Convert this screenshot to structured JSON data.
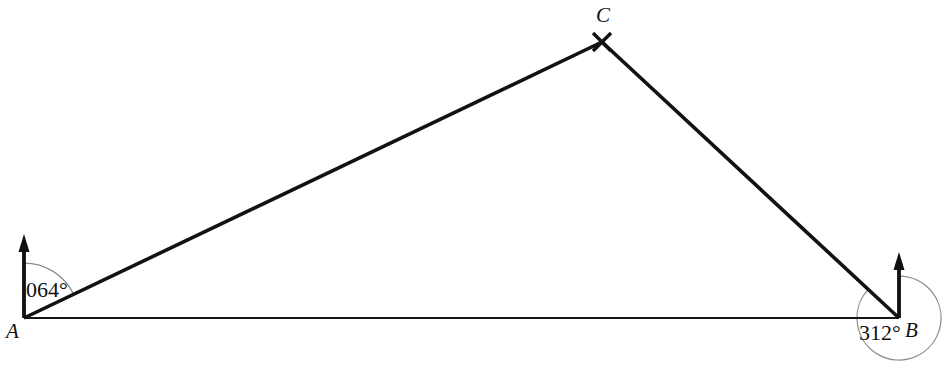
{
  "figure": {
    "type": "geometry-bearings-diagram",
    "background_color": "#ffffff",
    "width": 949,
    "height": 375
  },
  "points": {
    "A": {
      "label": "A",
      "x": 24,
      "y": 318,
      "label_x": 6,
      "label_y": 338
    },
    "B": {
      "label": "B",
      "x": 899,
      "y": 318,
      "label_x": 905,
      "label_y": 337
    },
    "C": {
      "label": "C",
      "x": 602,
      "y": 42,
      "label_x": 596,
      "label_y": 22
    }
  },
  "segments": [
    {
      "name": "segment-ac",
      "from": "A",
      "to": "C",
      "style": "thick"
    },
    {
      "name": "segment-cb",
      "from": "C",
      "to": "B",
      "style": "thick"
    },
    {
      "name": "segment-ab",
      "from": "A",
      "to": "B",
      "style": "thin"
    }
  ],
  "north_arrows": [
    {
      "name": "north-arrow-a",
      "at": "A",
      "base_x": 24,
      "base_y": 318,
      "tip_y": 237
    },
    {
      "name": "north-arrow-b",
      "at": "B",
      "base_x": 899,
      "base_y": 318,
      "tip_y": 255
    }
  ],
  "angles": [
    {
      "name": "angle-at-a",
      "vertex": "A",
      "value": "064°",
      "degrees": 64,
      "arc_radius": 55,
      "reflex": false,
      "label_x": 26,
      "label_y": 297,
      "arc_color": "#8d8d8d"
    },
    {
      "name": "angle-at-b",
      "vertex": "B",
      "value": "312°",
      "degrees": 312,
      "arc_radius": 42,
      "reflex": true,
      "label_x": 859,
      "label_y": 340,
      "arc_color": "#8d8d8d"
    }
  ],
  "markers": [
    {
      "name": "cross-marker-c",
      "at": "C",
      "glyph": "x",
      "size": 9
    }
  ],
  "colors": {
    "ink": "#121212",
    "arc_gray": "#8d8d8d",
    "background": "#ffffff"
  }
}
